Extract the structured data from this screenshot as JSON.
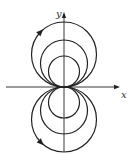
{
  "diagram": {
    "type": "family of circles tangent to x-axis at origin (dipole-like field lines)",
    "axes": {
      "x_label": "x",
      "y_label": "y",
      "origin": [
        64,
        87
      ],
      "x_axis": {
        "from": 6,
        "to": 120
      },
      "y_axis": {
        "from": 152,
        "to": 12
      }
    },
    "circles": [
      {
        "name": "upper-outer",
        "cx": 64,
        "cy": 54.5,
        "r": 32.5
      },
      {
        "name": "upper-middle",
        "cx": 64,
        "cy": 63.5,
        "r": 23.5
      },
      {
        "name": "upper-inner",
        "cx": 64,
        "cy": 71.5,
        "r": 15.5
      },
      {
        "name": "lower-outer",
        "cx": 64,
        "cy": 119.5,
        "r": 32.5
      },
      {
        "name": "lower-middle",
        "cx": 64,
        "cy": 110.5,
        "r": 23.5
      },
      {
        "name": "lower-inner",
        "cx": 64,
        "cy": 102.5,
        "r": 15.5
      }
    ],
    "arrows": [
      {
        "name": "upper-direction-arrow",
        "at": [
          40,
          31
        ],
        "direction": "clockwise"
      },
      {
        "name": "lower-direction-arrow",
        "at": [
          41,
          143
        ],
        "direction": "counterclockwise"
      }
    ],
    "stroke_color": "#222222"
  }
}
